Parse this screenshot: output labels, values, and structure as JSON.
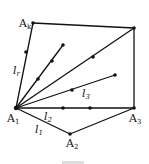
{
  "diagram": {
    "type": "polygon-triangulation",
    "vertices": [
      {
        "name": "A1",
        "label": "A",
        "sub": "1",
        "x": 16,
        "y": 108
      },
      {
        "name": "A2",
        "label": "A",
        "sub": "2",
        "x": 70,
        "y": 134
      },
      {
        "name": "A3",
        "label": "A",
        "sub": "3",
        "x": 134,
        "y": 108
      },
      {
        "name": "Ak",
        "label": "A",
        "sub": "k",
        "x": 33,
        "y": 23
      },
      {
        "name": "top-right",
        "label": "",
        "sub": "",
        "x": 134,
        "y": 28
      }
    ],
    "lines": [
      {
        "name": "l1",
        "label": "l",
        "sub": "1"
      },
      {
        "name": "l2",
        "label": "l",
        "sub": "2"
      },
      {
        "name": "l3",
        "label": "l",
        "sub": "3"
      },
      {
        "name": "lr",
        "label": "l",
        "sub": "r"
      }
    ],
    "stroke_color": "#111111",
    "background": "#ffffff"
  }
}
